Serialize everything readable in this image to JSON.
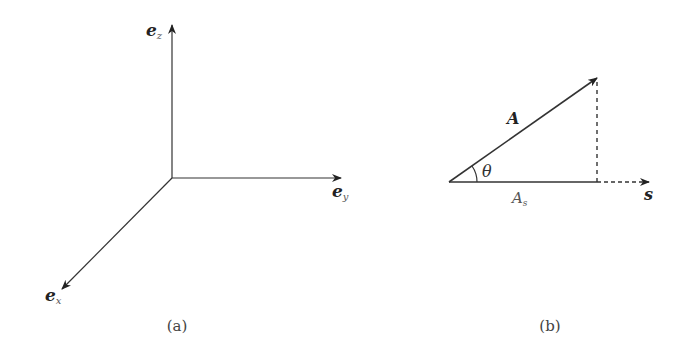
{
  "colors": {
    "background": "#ffffff",
    "line": "#333333",
    "muted_text": "#777777"
  },
  "panel_a": {
    "caption": "(a)",
    "axes": {
      "z": {
        "base": "e",
        "sub": "z"
      },
      "y": {
        "base": "e",
        "sub": "y"
      },
      "x": {
        "base": "e",
        "sub": "x"
      }
    }
  },
  "panel_b": {
    "caption": "(b)",
    "vector_label": "A",
    "angle_label": "θ",
    "projection": {
      "base": "A",
      "sub": "s"
    },
    "direction_label": "s"
  }
}
